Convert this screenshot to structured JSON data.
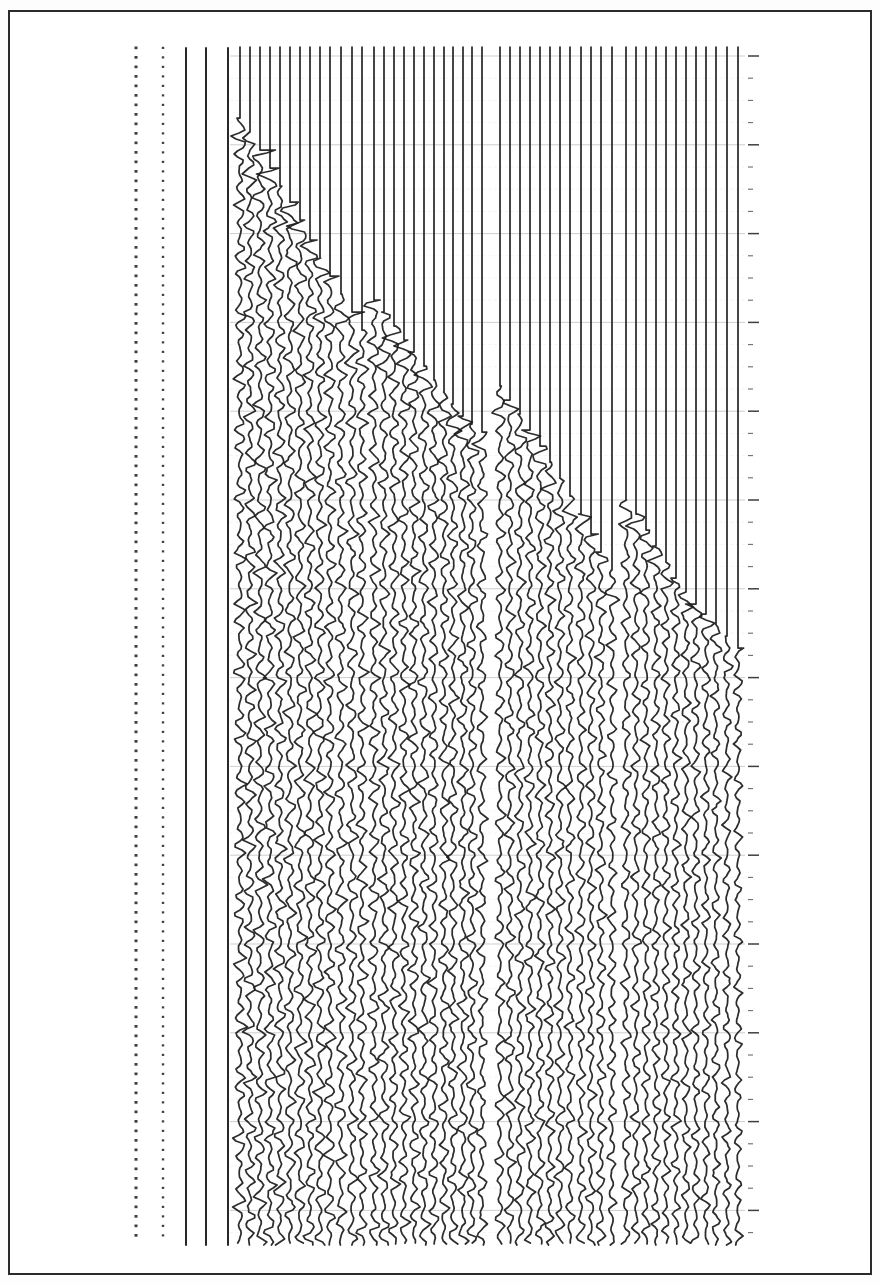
{
  "figure": {
    "kind": "seismic-record-section",
    "title": "",
    "caption": "",
    "background_color": "#ffffff",
    "ink_color": "#1d1d1d",
    "gridline_color": "#b9b9b9"
  },
  "frame": {
    "name": "page-border",
    "x": 8,
    "y": 10,
    "width": 864,
    "height": 1265,
    "stroke": "#2b2b2b",
    "stroke_width": 2
  },
  "plot_area": {
    "x": 120,
    "y": 45,
    "width": 640,
    "height": 1200,
    "top": 45,
    "bottom": 1245
  },
  "chart_data": {
    "type": "line",
    "title": "",
    "subtitle": "",
    "xlabel": "",
    "ylabel": "",
    "grid": true,
    "legend": "none",
    "orientation": "vertical-traces",
    "xlim": [
      0,
      640
    ],
    "ylim": [
      45,
      1245
    ],
    "axis": {
      "position": "right",
      "x": 748,
      "tick_spacing": 22.2,
      "major_every": 4,
      "tick_count": 54,
      "minor_tick_length": 5,
      "major_tick_length": 11
    },
    "gridlines": {
      "orientation": "horizontal",
      "spacing": 22.2,
      "first": 56,
      "count": 54,
      "major_every": 4,
      "minor_color": "#c9c9c9",
      "major_color": "#9a9a9a"
    },
    "dotted_markers": [
      {
        "name": "dotted-line-left",
        "x": 136,
        "y_start": 48,
        "y_end": 1243,
        "dot_spacing": 9.5,
        "dot_radius": 1.5
      },
      {
        "name": "dotted-line-second",
        "x": 163,
        "y_start": 48,
        "y_end": 1243,
        "dot_spacing": 9.5,
        "dot_radius": 1.2
      }
    ],
    "trace_groups": [
      {
        "name": "reference-traces",
        "x_start": 186,
        "x_end": 228,
        "count": 3,
        "onset": 1260,
        "amplitude": 0,
        "note": "flat reference / timing traces, no signal"
      },
      {
        "name": "group-1",
        "x_start": 240,
        "x_end": 362,
        "count": 13,
        "onset_first": 118,
        "onset_last": 330,
        "amplitude": 8.5
      },
      {
        "name": "group-2",
        "x_start": 374,
        "x_end": 482,
        "count": 12,
        "onset_first": 300,
        "onset_last": 432,
        "amplitude": 8.0
      },
      {
        "name": "group-3",
        "x_start": 500,
        "x_end": 612,
        "count": 12,
        "onset_first": 386,
        "onset_last": 570,
        "amplitude": 7.5
      },
      {
        "name": "group-4",
        "x_start": 626,
        "x_end": 740,
        "count": 12,
        "onset_first": 500,
        "onset_last": 648,
        "amplitude": 6.5
      }
    ],
    "series": [
      {
        "name": "trace-01",
        "x": 240,
        "first_break": 118,
        "amplitude": 9.0
      },
      {
        "name": "trace-02",
        "x": 250,
        "first_break": 132,
        "amplitude": 9.0
      },
      {
        "name": "trace-03",
        "x": 260,
        "first_break": 150,
        "amplitude": 9.0
      },
      {
        "name": "trace-04",
        "x": 270,
        "first_break": 168,
        "amplitude": 8.8
      },
      {
        "name": "trace-05",
        "x": 280,
        "first_break": 186,
        "amplitude": 8.8
      },
      {
        "name": "trace-06",
        "x": 290,
        "first_break": 202,
        "amplitude": 8.6
      },
      {
        "name": "trace-07",
        "x": 300,
        "first_break": 220,
        "amplitude": 8.6
      },
      {
        "name": "trace-08",
        "x": 310,
        "first_break": 240,
        "amplitude": 8.5
      },
      {
        "name": "trace-09",
        "x": 320,
        "first_break": 258,
        "amplitude": 8.5
      },
      {
        "name": "trace-10",
        "x": 330,
        "first_break": 276,
        "amplitude": 8.4
      },
      {
        "name": "trace-11",
        "x": 341,
        "first_break": 294,
        "amplitude": 8.4
      },
      {
        "name": "trace-12",
        "x": 352,
        "first_break": 312,
        "amplitude": 8.2
      },
      {
        "name": "trace-13",
        "x": 362,
        "first_break": 330,
        "amplitude": 8.2
      },
      {
        "name": "trace-14",
        "x": 374,
        "first_break": 300,
        "amplitude": 8.2
      },
      {
        "name": "trace-15",
        "x": 384,
        "first_break": 312,
        "amplitude": 8.2
      },
      {
        "name": "trace-16",
        "x": 394,
        "first_break": 326,
        "amplitude": 8.0
      },
      {
        "name": "trace-17",
        "x": 404,
        "first_break": 340,
        "amplitude": 8.0
      },
      {
        "name": "trace-18",
        "x": 414,
        "first_break": 352,
        "amplitude": 8.0
      },
      {
        "name": "trace-19",
        "x": 424,
        "first_break": 366,
        "amplitude": 7.9
      },
      {
        "name": "trace-20",
        "x": 434,
        "first_break": 380,
        "amplitude": 7.9
      },
      {
        "name": "trace-21",
        "x": 444,
        "first_break": 392,
        "amplitude": 7.8
      },
      {
        "name": "trace-22",
        "x": 453,
        "first_break": 404,
        "amplitude": 7.8
      },
      {
        "name": "trace-23",
        "x": 463,
        "first_break": 416,
        "amplitude": 7.8
      },
      {
        "name": "trace-24",
        "x": 472,
        "first_break": 424,
        "amplitude": 7.7
      },
      {
        "name": "trace-25",
        "x": 482,
        "first_break": 432,
        "amplitude": 7.7
      },
      {
        "name": "trace-26",
        "x": 500,
        "first_break": 386,
        "amplitude": 7.6
      },
      {
        "name": "trace-27",
        "x": 510,
        "first_break": 400,
        "amplitude": 7.6
      },
      {
        "name": "trace-28",
        "x": 520,
        "first_break": 414,
        "amplitude": 7.5
      },
      {
        "name": "trace-29",
        "x": 530,
        "first_break": 430,
        "amplitude": 7.5
      },
      {
        "name": "trace-30",
        "x": 540,
        "first_break": 446,
        "amplitude": 7.5
      },
      {
        "name": "trace-31",
        "x": 550,
        "first_break": 462,
        "amplitude": 7.4
      },
      {
        "name": "trace-32",
        "x": 560,
        "first_break": 478,
        "amplitude": 7.4
      },
      {
        "name": "trace-33",
        "x": 570,
        "first_break": 496,
        "amplitude": 7.3
      },
      {
        "name": "trace-34",
        "x": 581,
        "first_break": 514,
        "amplitude": 7.3
      },
      {
        "name": "trace-35",
        "x": 591,
        "first_break": 534,
        "amplitude": 7.2
      },
      {
        "name": "trace-36",
        "x": 601,
        "first_break": 552,
        "amplitude": 7.2
      },
      {
        "name": "trace-37",
        "x": 612,
        "first_break": 570,
        "amplitude": 7.1
      },
      {
        "name": "trace-38",
        "x": 626,
        "first_break": 500,
        "amplitude": 7.0
      },
      {
        "name": "trace-39",
        "x": 636,
        "first_break": 514,
        "amplitude": 7.0
      },
      {
        "name": "trace-40",
        "x": 646,
        "first_break": 530,
        "amplitude": 6.9
      },
      {
        "name": "trace-41",
        "x": 656,
        "first_break": 546,
        "amplitude": 6.9
      },
      {
        "name": "trace-42",
        "x": 666,
        "first_break": 562,
        "amplitude": 6.8
      },
      {
        "name": "trace-43",
        "x": 676,
        "first_break": 578,
        "amplitude": 6.8
      },
      {
        "name": "trace-44",
        "x": 686,
        "first_break": 592,
        "amplitude": 6.7
      },
      {
        "name": "trace-45",
        "x": 696,
        "first_break": 604,
        "amplitude": 6.6
      },
      {
        "name": "trace-46",
        "x": 706,
        "first_break": 614,
        "amplitude": 6.5
      },
      {
        "name": "trace-47",
        "x": 716,
        "first_break": 624,
        "amplitude": 6.4
      },
      {
        "name": "trace-48",
        "x": 727,
        "first_break": 636,
        "amplitude": 6.3
      },
      {
        "name": "trace-49",
        "x": 738,
        "first_break": 648,
        "amplitude": 6.2
      }
    ]
  }
}
